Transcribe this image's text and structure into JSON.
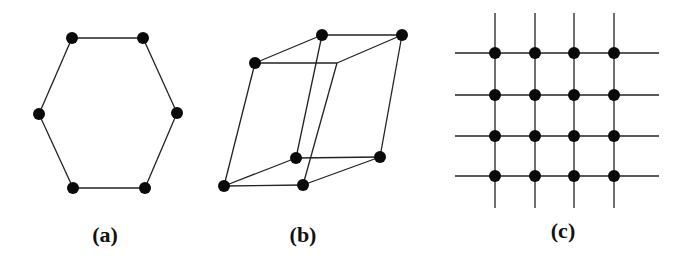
{
  "figure": {
    "panels": [
      {
        "id": "a",
        "label": "(a)",
        "shape": "hexagon",
        "label_pos": [
          105,
          222
        ],
        "nodes": [
          [
            72,
            38
          ],
          [
            143,
            38
          ],
          [
            177,
            113
          ],
          [
            145,
            188
          ],
          [
            73,
            188
          ],
          [
            39,
            114
          ]
        ],
        "edges": [
          [
            0,
            1
          ],
          [
            1,
            2
          ],
          [
            2,
            3
          ],
          [
            3,
            4
          ],
          [
            4,
            5
          ],
          [
            5,
            0
          ]
        ]
      },
      {
        "id": "b",
        "label": "(b)",
        "shape": "parallelepiped",
        "label_pos": [
          303,
          222
        ],
        "nodes": [
          [
            255,
            63
          ],
          [
            322,
            35
          ],
          [
            402,
            35
          ],
          [
            337,
            63
          ],
          [
            224,
            186
          ],
          [
            296,
            158
          ],
          [
            380,
            157
          ],
          [
            303,
            185
          ]
        ],
        "node_visible": [
          true,
          true,
          true,
          false,
          true,
          true,
          true,
          true
        ],
        "edges": [
          [
            0,
            1
          ],
          [
            1,
            2
          ],
          [
            2,
            3
          ],
          [
            3,
            0
          ],
          [
            4,
            5
          ],
          [
            5,
            6
          ],
          [
            6,
            7
          ],
          [
            7,
            4
          ],
          [
            0,
            4
          ],
          [
            1,
            5
          ],
          [
            2,
            6
          ],
          [
            3,
            7
          ]
        ]
      },
      {
        "id": "c",
        "label": "(c)",
        "shape": "square-lattice",
        "label_pos": [
          563,
          218
        ],
        "columns": [
          495,
          535,
          574,
          614
        ],
        "rows": [
          53,
          95,
          136,
          176
        ],
        "h_extent": [
          455,
          659
        ],
        "v_extent": [
          13,
          208
        ]
      }
    ],
    "colors": {
      "line": "#222222",
      "node": "#0a0a0a",
      "background": "#ffffff"
    }
  }
}
